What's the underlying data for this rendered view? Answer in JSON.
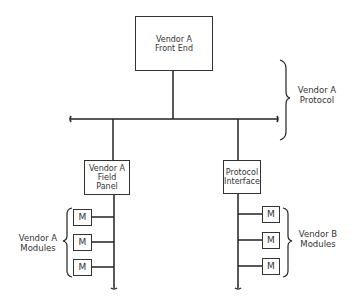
{
  "diagram": {
    "front_end": {
      "label_line1": "Vendor A",
      "label_line2": "Front End"
    },
    "protocol_brace": {
      "label_line1": "Vendor A",
      "label_line2": "Protocol"
    },
    "field_panel": {
      "label_line1": "Vendor A",
      "label_line2": "Field",
      "label_line3": "Panel"
    },
    "protocol_interface": {
      "label_line1": "Protocol",
      "label_line2": "Interface"
    },
    "vendor_a_modules": {
      "label_line1": "Vendor A",
      "label_line2": "Modules",
      "modules": [
        "M",
        "M",
        "M"
      ]
    },
    "vendor_b_modules": {
      "label_line1": "Vendor B",
      "label_line2": "Modules",
      "modules": [
        "M",
        "M",
        "M"
      ]
    }
  }
}
